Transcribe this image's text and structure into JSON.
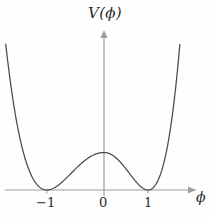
{
  "figure": {
    "name": "double-well-potential-plot",
    "caption": ""
  },
  "axes": {
    "y_label": "V(ϕ)",
    "x_label": "ϕ",
    "axis_color": "#9a9a9a",
    "arrowheads": true
  },
  "ticks": {
    "x": [
      {
        "value": -1,
        "label": "−1",
        "px": 47
      },
      {
        "value": 0,
        "label": "0",
        "px": 104
      },
      {
        "value": 1,
        "label": "1",
        "px": 148
      }
    ]
  },
  "curve": {
    "color": "#4a4a4a",
    "stroke_width": 1.2
  },
  "chart_data": {
    "type": "line",
    "title": "",
    "subtitle": "",
    "xlabel": "ϕ",
    "ylabel": "V(ϕ)",
    "xlim": [
      -1.85,
      1.75
    ],
    "ylim": [
      0,
      3.3
    ],
    "xticks": [
      -1,
      0,
      1
    ],
    "xticklabels": [
      "−1",
      "0",
      "1"
    ],
    "yticks": [],
    "yticklabels": [],
    "grid": false,
    "legend": null,
    "annotations": [],
    "series": [
      {
        "name": "V(ϕ) = λ(ϕ² − 1)²",
        "formula": "V = (phi^2 - 1)^2",
        "x": [
          -1.85,
          -1.75,
          -1.65,
          -1.55,
          -1.45,
          -1.35,
          -1.25,
          -1.15,
          -1.05,
          -1.0,
          -0.95,
          -0.85,
          -0.75,
          -0.65,
          -0.55,
          -0.45,
          -0.35,
          -0.25,
          -0.15,
          -0.05,
          0.0,
          0.05,
          0.15,
          0.25,
          0.35,
          0.45,
          0.55,
          0.65,
          0.75,
          0.85,
          0.95,
          1.0,
          1.05,
          1.15,
          1.25,
          1.35,
          1.45,
          1.55,
          1.65,
          1.75
        ],
        "y": [
          5.64,
          4.28,
          3.17,
          2.28,
          1.57,
          1.04,
          0.64,
          0.36,
          0.01,
          0.0,
          0.01,
          0.08,
          0.19,
          0.33,
          0.48,
          0.64,
          0.77,
          0.88,
          0.96,
          1.0,
          1.0,
          1.0,
          0.96,
          0.88,
          0.77,
          0.64,
          0.48,
          0.33,
          0.19,
          0.08,
          0.01,
          0.0,
          0.01,
          0.36,
          0.64,
          1.04,
          1.57,
          2.28,
          3.17,
          4.28
        ],
        "minima_at": [
          -1,
          1
        ],
        "local_maximum_at": 0,
        "color": "#4a4a4a"
      }
    ]
  }
}
